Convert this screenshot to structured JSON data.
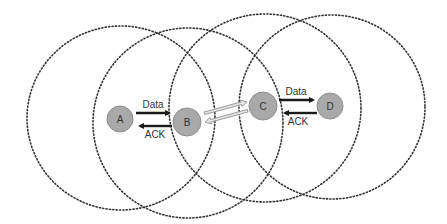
{
  "diagram": {
    "type": "wireless-network-hidden-exposed-terminal",
    "nodes": [
      {
        "id": "A",
        "label": "A",
        "cx": 120,
        "cy": 119,
        "r": 13
      },
      {
        "id": "B",
        "label": "B",
        "cx": 187,
        "cy": 122,
        "r": 14
      },
      {
        "id": "C",
        "label": "C",
        "cx": 263,
        "cy": 106,
        "r": 14
      },
      {
        "id": "D",
        "label": "D",
        "cx": 330,
        "cy": 106,
        "r": 13
      }
    ],
    "ranges": [
      {
        "node": "A",
        "cx": 121,
        "cy": 118,
        "rx": 94,
        "ry": 92
      },
      {
        "node": "B",
        "cx": 188,
        "cy": 123,
        "rx": 95,
        "ry": 95
      },
      {
        "node": "C",
        "cx": 265,
        "cy": 108,
        "rx": 96,
        "ry": 94
      },
      {
        "node": "D",
        "cx": 332,
        "cy": 107,
        "rx": 93,
        "ry": 92
      }
    ],
    "links": [
      {
        "from": "A",
        "to": "B",
        "data_label": "Data",
        "ack_label": "ACK"
      },
      {
        "from": "C",
        "to": "D",
        "data_label": "Data",
        "ack_label": "ACK"
      },
      {
        "from": "B",
        "to": "C",
        "style": "hollow-bidirectional"
      }
    ],
    "colors": {
      "node_fill": "#a9a9a9",
      "range_stroke": "#333333",
      "arrow": "#1a1a1a"
    }
  }
}
